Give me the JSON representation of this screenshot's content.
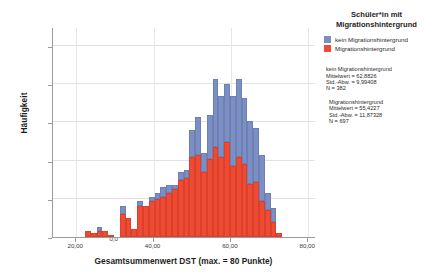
{
  "chart_data": {
    "type": "bar",
    "subtype": "stacked-histogram",
    "title": "",
    "xlabel": "Gesamtsummenwert DST (max. = 80 Punkte)",
    "ylabel": "Häufigkeit",
    "xlim": [
      14,
      82
    ],
    "ylim": [
      0,
      110
    ],
    "xticks": [
      "20,00",
      "40,00",
      "60,00",
      "80,00"
    ],
    "xtick_values": [
      20,
      40,
      60,
      80
    ],
    "yticks": [
      "0,0",
      "20,0",
      "40,0",
      "60,0",
      "80,0",
      "100,0"
    ],
    "ytick_values": [
      0,
      20,
      40,
      60,
      80,
      100
    ],
    "grid": true,
    "legend_position": "right",
    "bin_width": 1.5,
    "x": [
      21.5,
      23.0,
      24.5,
      26.0,
      27.5,
      29.0,
      30.5,
      32.0,
      33.5,
      35.0,
      36.5,
      38.0,
      39.5,
      41.0,
      42.5,
      44.0,
      45.5,
      47.0,
      48.5,
      50.0,
      51.5,
      53.0,
      54.5,
      56.0,
      57.5,
      59.0,
      60.5,
      62.0,
      63.5,
      65.0,
      66.5,
      68.0,
      69.5,
      71.0,
      72.5,
      74.0,
      75.5,
      77.0
    ],
    "series": [
      {
        "name": "Migrationshintergrund",
        "color": "#ee4b35",
        "values": [
          0,
          3,
          2,
          3,
          3,
          1,
          0,
          12,
          10,
          4,
          16,
          16,
          19,
          20,
          21,
          23,
          25,
          30,
          31,
          42,
          43,
          34,
          41,
          47,
          42,
          50,
          37,
          42,
          38,
          28,
          29,
          19,
          14,
          8,
          2,
          0,
          0,
          0
        ]
      },
      {
        "name": "kein Migrationshintergrund",
        "color": "#7b8fc4",
        "values": [
          0,
          0,
          0,
          2,
          0,
          0,
          0,
          4,
          0,
          0,
          3,
          0,
          2,
          3,
          5,
          4,
          2,
          4,
          4,
          14,
          20,
          10,
          23,
          36,
          32,
          30,
          37,
          41,
          35,
          33,
          28,
          24,
          9,
          7,
          0,
          0,
          0,
          0
        ]
      }
    ],
    "legend": [
      {
        "label": "kein Migrationshintergrund",
        "color": "#7b8fc4"
      },
      {
        "label": "Migrationshintergrund",
        "color": "#ee4b35"
      }
    ],
    "legend_title": "Schüler*in mit Migrationshintergrund",
    "stats": [
      {
        "group": "kein Migrationshintergrund",
        "mean_label": "Mittelwert = 62,8826",
        "sd_label": "Std.-Abw. = 9,99408",
        "n_label": "N = 382"
      },
      {
        "group": "Migrationshintergrund",
        "mean_label": "Mittelwert = 55,4227",
        "sd_label": "Std.-Abw. = 11,87328",
        "n_label": "N = 697"
      }
    ]
  },
  "axes": {
    "ylabel": "Häufigkeit",
    "xlabel": "Gesamtsummenwert DST (max. = 80 Punkte)"
  },
  "legend_panel": {
    "title_line1": "Schüler*in mit",
    "title_line2": "Migrationshintergrund",
    "item_blue": "kein Migrationshintergrund",
    "item_red": "Migrationshintergrund",
    "stat1_head": "kein Migrationshintergrund",
    "stat1_mean": "Mittelwert = 62,8826",
    "stat1_sd": "Std.-Abw. = 9,99408",
    "stat1_n": "N = 382",
    "stat2_head": "Migrationshintergrund",
    "stat2_mean": "Mittelwert = 55,4227",
    "stat2_sd": "Std.-Abw. = 11,87328",
    "stat2_n": "N = 697"
  },
  "colors": {
    "blue": "#7b8fc4",
    "red": "#ee4b35",
    "grid": "#e2e2e2",
    "axis": "#9a9a9a"
  }
}
